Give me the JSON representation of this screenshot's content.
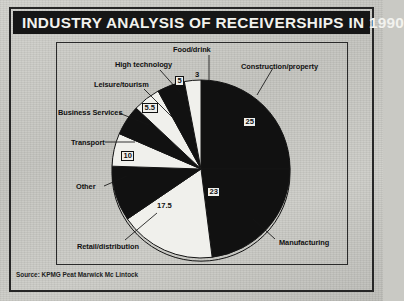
{
  "header": {
    "title": "INDUSTRY ANALYSIS OF RECEIVERSHIPS IN 1990"
  },
  "footer": {
    "source": "Source: KPMG Peat Marwick Mc Lintock"
  },
  "colors": {
    "title_bar": "#161616",
    "title_text": "#f2f2ee",
    "slice_dark": "#111111",
    "slice_light": "#f0f0ec",
    "paper": "#c9c9c4",
    "frame": "#262626"
  },
  "chart_data": {
    "type": "pie",
    "title": "INDUSTRY ANALYSIS OF RECEIVERSHIPS IN 1990",
    "subtitle": "",
    "xlabel": "",
    "ylabel": "",
    "units": "percent",
    "legend": "none",
    "grid": false,
    "start_angle_deg": 0,
    "direction": "clockwise",
    "categories": [
      "Construction/property",
      "Manufacturing",
      "Retail/distribution",
      "Other",
      "Transport",
      "Business Services",
      "Leisure/tourism",
      "High technology",
      "Food/drink"
    ],
    "values": [
      25,
      23,
      17.5,
      10,
      6,
      5.5,
      5,
      5,
      3
    ],
    "total": 100,
    "slices": [
      {
        "label": "Construction/property",
        "value": 25,
        "value_text": "25",
        "fill": "dark",
        "value_style": "onblack"
      },
      {
        "label": "Manufacturing",
        "value": 23,
        "value_text": "23",
        "fill": "dark",
        "value_style": "onblack"
      },
      {
        "label": "Retail/distribution",
        "value": 17.5,
        "value_text": "17.5",
        "fill": "light",
        "value_style": "onwhite"
      },
      {
        "label": "Other",
        "value": 10,
        "value_text": "10",
        "fill": "dark",
        "value_style": "onblack"
      },
      {
        "label": "Transport",
        "value": 6,
        "value_text": "6",
        "fill": "light",
        "value_style": "onwhite"
      },
      {
        "label": "Business Services",
        "value": 5.5,
        "value_text": "5.5",
        "fill": "dark",
        "value_style": "onblack"
      },
      {
        "label": "Leisure/tourism",
        "value": 5,
        "value_text": "5",
        "fill": "light",
        "value_style": "onwhite"
      },
      {
        "label": "High technology",
        "value": 5,
        "value_text": "5",
        "fill": "dark",
        "value_style": "onblack"
      },
      {
        "label": "Food/drink",
        "value": 3,
        "value_text": "3",
        "fill": "light",
        "value_style": "onwhite"
      }
    ]
  }
}
